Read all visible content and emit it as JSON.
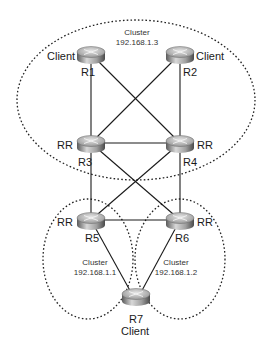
{
  "diagram": {
    "type": "BGP route reflector cluster topology",
    "clusters": [
      {
        "id": "top",
        "label": "Cluster",
        "address": "192.168.1.3"
      },
      {
        "id": "left",
        "label": "Cluster",
        "address": "192.168.1.1"
      },
      {
        "id": "right",
        "label": "Cluster",
        "address": "192.168.1.2"
      }
    ],
    "routers": [
      {
        "id": "R1",
        "name": "R1",
        "role": "Client"
      },
      {
        "id": "R2",
        "name": "R2",
        "role": "Client"
      },
      {
        "id": "R3",
        "name": "R3",
        "role": "RR"
      },
      {
        "id": "R4",
        "name": "R4",
        "role": "RR"
      },
      {
        "id": "R5",
        "name": "R5",
        "role": "RR"
      },
      {
        "id": "R6",
        "name": "R6",
        "role": "RR"
      },
      {
        "id": "R7",
        "name": "R7",
        "role": "Client"
      }
    ],
    "links": [
      [
        "R1",
        "R3"
      ],
      [
        "R1",
        "R4"
      ],
      [
        "R2",
        "R3"
      ],
      [
        "R2",
        "R4"
      ],
      [
        "R3",
        "R4"
      ],
      [
        "R3",
        "R5"
      ],
      [
        "R3",
        "R6"
      ],
      [
        "R4",
        "R5"
      ],
      [
        "R4",
        "R6"
      ],
      [
        "R5",
        "R6"
      ],
      [
        "R5",
        "R7"
      ],
      [
        "R6",
        "R7"
      ]
    ]
  }
}
